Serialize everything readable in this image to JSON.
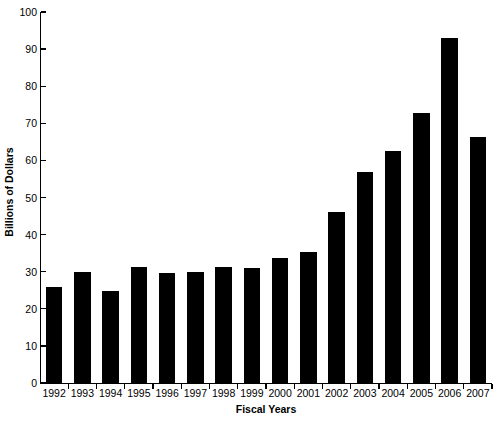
{
  "chart_data": {
    "type": "bar",
    "title": "",
    "xlabel": "Fiscal Years",
    "ylabel": "Billions of Dollars",
    "categories": [
      "1992",
      "1993",
      "1994",
      "1995",
      "1996",
      "1997",
      "1998",
      "1999",
      "2000",
      "2001",
      "2002",
      "2003",
      "2004",
      "2005",
      "2006",
      "2007"
    ],
    "values": [
      25.9,
      30.0,
      24.7,
      31.2,
      29.6,
      29.9,
      31.3,
      31.1,
      33.7,
      35.3,
      46.1,
      57.0,
      62.5,
      72.8,
      93.1,
      66.3
    ],
    "ylim": [
      0,
      100
    ],
    "ytick_values": [
      0,
      10,
      20,
      30,
      40,
      50,
      60,
      70,
      80,
      90,
      100
    ],
    "ytick_labels": [
      "0",
      "10",
      "20",
      "30",
      "40",
      "50",
      "60",
      "70",
      "80",
      "90",
      "100"
    ],
    "grid": false,
    "legend": null,
    "bar_color": "#000000",
    "background_color": "#ffffff",
    "axis_color": "#000000"
  }
}
